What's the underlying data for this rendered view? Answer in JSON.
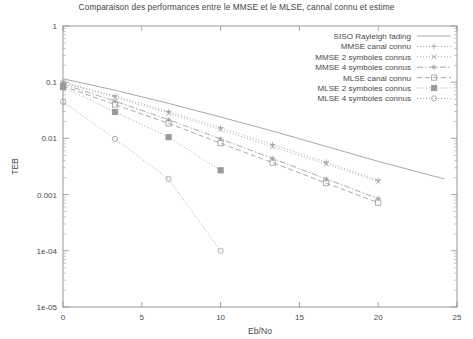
{
  "chart_data": {
    "type": "line",
    "title": "Comparaison des performances entre le MMSE et le MLSE, cannal connu et estime",
    "xlabel": "Eb/No",
    "ylabel": "TEB",
    "xlim": [
      0,
      25
    ],
    "ylim": [
      1e-05,
      1
    ],
    "yscale": "log",
    "grid": false,
    "legend_position": "top-right",
    "xticks": [
      "0",
      "5",
      "10",
      "15",
      "20",
      "25"
    ],
    "xtick_values": [
      0,
      5,
      10,
      15,
      20,
      25
    ],
    "yticks": [
      "1",
      "0.1",
      "0.01",
      "0.001",
      "1e-04",
      "1e-05"
    ],
    "ytick_values": [
      1,
      0.1,
      0.01,
      0.001,
      0.0001,
      1e-05
    ],
    "series": [
      {
        "name": "SISO Rayleigh fading",
        "marker": "none",
        "dash": "solid",
        "color": "#9a9a9a",
        "x": [
          0,
          3.3,
          6.7,
          10,
          13.3,
          16.7,
          20,
          24.2
        ],
        "y": [
          0.115,
          0.072,
          0.042,
          0.024,
          0.0135,
          0.0072,
          0.0039,
          0.0019
        ]
      },
      {
        "name": "MMSE canal connu",
        "marker": "plus",
        "dash": "dotted",
        "color": "#9a9a9a",
        "x": [
          0,
          3.3,
          6.7,
          10,
          13.3,
          16.7,
          20
        ],
        "y": [
          0.1,
          0.057,
          0.03,
          0.0155,
          0.0078,
          0.0038,
          0.0018
        ]
      },
      {
        "name": "MMSE 2 symboles connus",
        "marker": "cross",
        "dash": "dotted",
        "color": "#9a9a9a",
        "x": [
          0,
          3.3,
          6.7,
          10,
          13.3,
          16.7,
          20
        ],
        "y": [
          0.098,
          0.054,
          0.028,
          0.0142,
          0.0071,
          0.0035,
          0.0017
        ]
      },
      {
        "name": "MMSE 4 symboles connus",
        "marker": "star",
        "dash": "dashdot",
        "color": "#9a9a9a",
        "x": [
          0,
          3.3,
          6.7,
          10,
          13.3,
          16.7,
          20
        ],
        "y": [
          0.092,
          0.046,
          0.0215,
          0.0098,
          0.0044,
          0.0019,
          0.00085
        ]
      },
      {
        "name": "MLSE canal connu",
        "marker": "square-open",
        "dash": "dashed",
        "color": "#9a9a9a",
        "x": [
          0,
          3.3,
          6.7,
          10,
          13.3,
          16.7,
          20
        ],
        "y": [
          0.085,
          0.04,
          0.0185,
          0.0082,
          0.0037,
          0.0016,
          0.00072
        ]
      },
      {
        "name": "MLSE 2 symboles connus",
        "marker": "filled-square",
        "dash": "dotted",
        "color": "#9a9a9a",
        "x": [
          0,
          3.3,
          6.7,
          10
        ],
        "y": [
          0.082,
          0.0295,
          0.0105,
          0.0027
        ]
      },
      {
        "name": "MLSE 4 symboles connus",
        "marker": "circle-open",
        "dash": "dotted",
        "color": "#9a9a9a",
        "x": [
          0,
          3.3,
          6.7,
          10
        ],
        "y": [
          0.045,
          0.0098,
          0.0019,
          0.0001
        ]
      }
    ]
  }
}
